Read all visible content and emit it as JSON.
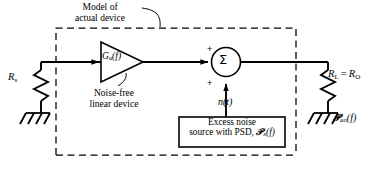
{
  "diagram": {
    "type": "circuit-block-diagram",
    "title_annotation": {
      "line1": "Model of",
      "line2": "actual device"
    },
    "labels": {
      "source_resistor": {
        "symbol": "R",
        "subscript": "s",
        "full": "R s"
      },
      "amplifier_gain": {
        "symbol": "G",
        "subscript": "a",
        "arg": "(f)",
        "full": "Ga(f)"
      },
      "amplifier_note": {
        "line1": "Noise-free",
        "line2": "linear device"
      },
      "summer_symbol": "Σ",
      "summer_input_sign_top": "+",
      "summer_input_sign_bottom": "+",
      "noise_signal": "n(t)",
      "load_resistor": {
        "left": "R",
        "left_sub": "L",
        "eq": "=",
        "right": "R",
        "right_sub": "O",
        "full": "R L = R O"
      },
      "output_psd": {
        "symbol": "𝒫",
        "subscript": "ao",
        "arg": "(f)",
        "full": "Pao(f)"
      }
    },
    "noise_source_box": {
      "line1": "Excess noise",
      "line2_prefix": "source with PSD, ",
      "line2_symbol": "𝒫",
      "line2_subscript": "x",
      "line2_arg": "(f)",
      "full": "Excess noise source with PSD, Px(f)"
    },
    "colors": {
      "ink": "#000000",
      "background": "#ffffff"
    },
    "geometry": {
      "canvas_width": 374,
      "canvas_height": 174,
      "dashed_box": {
        "x": 56,
        "y": 28,
        "width": 240,
        "height": 127
      },
      "dashed_box_style": "dashed",
      "signal_line_y": 62
    }
  }
}
